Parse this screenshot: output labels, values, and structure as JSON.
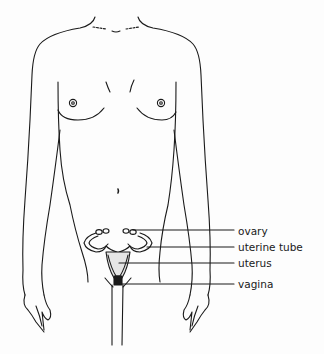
{
  "diagram": {
    "line_color": "#1a1a1a",
    "background": "#fdfdfd",
    "labels": [
      {
        "text": "ovary",
        "x": 238,
        "y": 227
      },
      {
        "text": "uterine tube",
        "x": 238,
        "y": 243
      },
      {
        "text": "uterus",
        "x": 238,
        "y": 260
      },
      {
        "text": "vagina",
        "x": 238,
        "y": 281
      }
    ]
  }
}
